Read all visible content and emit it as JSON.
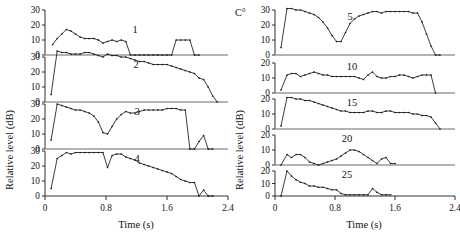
{
  "figure": {
    "y_axis_title": "Relative level (dB)",
    "x_axis_title": "Time (s)",
    "corner_label": "C°"
  },
  "axes": {
    "x_ticks": [
      "0",
      "0.8",
      "1.6",
      "2.4"
    ],
    "x_tick_values": [
      0,
      0.8,
      1.6,
      2.4
    ],
    "x_range": [
      0,
      2.4
    ],
    "y_ticks_30": [
      "0",
      "10",
      "20",
      "30"
    ],
    "y_ticks_20": [
      "0",
      "10",
      "20"
    ],
    "y_tick_values_30": [
      0,
      10,
      20,
      30
    ],
    "y_tick_values_20": [
      0,
      10,
      20
    ]
  },
  "colors": {
    "line": "#1a1a1a",
    "baseline": "#9a9a9a",
    "text": "#111111",
    "background": "#ffffff"
  },
  "chart_data": [
    {
      "type": "line",
      "title": "1",
      "panel_label": "1",
      "column": "left",
      "xlabel": "Time (s)",
      "ylabel": "Relative level (dB)",
      "xlim": [
        0,
        2.4
      ],
      "ylim": [
        0,
        30
      ],
      "grid": false,
      "legend": "none",
      "x": [
        0.1,
        0.16,
        0.22,
        0.28,
        0.34,
        0.4,
        0.46,
        0.52,
        0.58,
        0.64,
        0.7,
        0.76,
        0.82,
        0.88,
        0.94,
        1.0,
        1.06,
        1.12,
        1.18,
        1.24,
        1.3,
        1.36,
        1.42,
        1.48,
        1.54,
        1.6,
        1.66,
        1.72,
        1.78,
        1.84,
        1.9,
        1.96,
        2.02
      ],
      "y": [
        7,
        11,
        14,
        17,
        16,
        14,
        12,
        11,
        11,
        11,
        10,
        8,
        9,
        10,
        9,
        10,
        9,
        0,
        0,
        0,
        0,
        0,
        0,
        0,
        0,
        0,
        0,
        10,
        10,
        10,
        10,
        0,
        0
      ]
    },
    {
      "type": "line",
      "title": "2",
      "panel_label": "2",
      "column": "left",
      "xlabel": "Time (s)",
      "ylabel": "Relative level (dB)",
      "xlim": [
        0,
        2.4
      ],
      "ylim": [
        0,
        30
      ],
      "grid": false,
      "legend": "none",
      "x": [
        0.08,
        0.16,
        0.22,
        0.28,
        0.34,
        0.4,
        0.46,
        0.52,
        0.58,
        0.64,
        0.7,
        0.76,
        0.82,
        0.88,
        0.94,
        1.0,
        1.06,
        1.12,
        1.18,
        1.24,
        1.3,
        1.36,
        1.42,
        1.48,
        1.54,
        1.6,
        1.66,
        1.72,
        1.78,
        1.84,
        1.9,
        1.96,
        2.02,
        2.08,
        2.14,
        2.2,
        2.26
      ],
      "y": [
        5,
        34,
        33,
        33,
        32,
        32,
        32,
        33,
        33,
        32,
        31,
        30,
        32,
        31,
        31,
        30,
        30,
        29,
        28,
        27,
        27,
        26,
        25,
        25,
        25,
        25,
        24,
        23,
        22,
        21,
        20,
        19,
        16,
        15,
        10,
        4,
        0
      ]
    },
    {
      "type": "line",
      "title": "3",
      "panel_label": "3",
      "column": "left",
      "xlabel": "Time (s)",
      "ylabel": "Relative level (dB)",
      "xlim": [
        0,
        2.4
      ],
      "ylim": [
        0,
        30
      ],
      "grid": false,
      "legend": "none",
      "x": [
        0.08,
        0.16,
        0.22,
        0.28,
        0.34,
        0.4,
        0.46,
        0.52,
        0.58,
        0.64,
        0.7,
        0.76,
        0.82,
        0.88,
        0.94,
        1.0,
        1.06,
        1.12,
        1.18,
        1.24,
        1.3,
        1.36,
        1.42,
        1.48,
        1.54,
        1.6,
        1.66,
        1.72,
        1.78,
        1.84,
        1.9,
        1.96,
        2.02,
        2.08,
        2.14,
        2.2
      ],
      "y": [
        6,
        30,
        29,
        28,
        27,
        26,
        26,
        25,
        24,
        22,
        18,
        11,
        10,
        15,
        20,
        23,
        25,
        24,
        24,
        25,
        26,
        26,
        26,
        26,
        26,
        27,
        27,
        27,
        26,
        26,
        0,
        0,
        5,
        9,
        0,
        0
      ]
    },
    {
      "type": "line",
      "title": "4",
      "panel_label": "4",
      "column": "left",
      "xlabel": "Time (s)",
      "ylabel": "Relative level (dB)",
      "xlim": [
        0,
        2.4
      ],
      "ylim": [
        0,
        30
      ],
      "grid": false,
      "legend": "none",
      "x": [
        0.08,
        0.16,
        0.22,
        0.28,
        0.34,
        0.4,
        0.46,
        0.52,
        0.58,
        0.64,
        0.7,
        0.76,
        0.82,
        0.88,
        0.94,
        1.0,
        1.06,
        1.12,
        1.18,
        1.24,
        1.3,
        1.36,
        1.42,
        1.48,
        1.54,
        1.6,
        1.66,
        1.72,
        1.78,
        1.84,
        1.9,
        1.96,
        2.02,
        2.08,
        2.14,
        2.2
      ],
      "y": [
        5,
        25,
        27,
        29,
        28,
        29,
        29,
        29,
        29,
        29,
        29,
        29,
        19,
        27,
        28,
        28,
        26,
        25,
        24,
        22,
        21,
        20,
        19,
        18,
        17,
        16,
        15,
        13,
        11,
        10,
        9,
        9,
        0,
        4,
        0,
        0
      ]
    },
    {
      "type": "line",
      "title": "5",
      "panel_label": "5",
      "column": "right",
      "xlabel": "Time (s)",
      "ylabel": "Relative level (dB)",
      "xlim": [
        0,
        2.4
      ],
      "ylim": [
        0,
        30
      ],
      "grid": false,
      "legend": "none",
      "x": [
        0.08,
        0.16,
        0.22,
        0.28,
        0.34,
        0.4,
        0.46,
        0.52,
        0.58,
        0.64,
        0.7,
        0.76,
        0.82,
        0.88,
        0.94,
        1.0,
        1.06,
        1.12,
        1.18,
        1.24,
        1.3,
        1.36,
        1.42,
        1.48,
        1.54,
        1.6,
        1.66,
        1.72,
        1.78,
        1.84,
        1.9,
        1.96,
        2.02,
        2.08,
        2.14,
        2.2
      ],
      "y": [
        5,
        31,
        31,
        30,
        30,
        29,
        28,
        27,
        25,
        22,
        18,
        13,
        9,
        9,
        15,
        21,
        24,
        26,
        27,
        28,
        29,
        29,
        28,
        29,
        29,
        29,
        29,
        29,
        29,
        28,
        28,
        22,
        14,
        6,
        0,
        0
      ]
    },
    {
      "type": "line",
      "title": "10",
      "panel_label": "10",
      "column": "right",
      "xlabel": "Time (s)",
      "ylabel": "Relative level (dB)",
      "xlim": [
        0,
        2.4
      ],
      "ylim": [
        0,
        20
      ],
      "grid": false,
      "legend": "none",
      "x": [
        0.08,
        0.16,
        0.22,
        0.28,
        0.34,
        0.4,
        0.46,
        0.52,
        0.58,
        0.64,
        0.7,
        0.76,
        0.82,
        0.88,
        0.94,
        1.0,
        1.06,
        1.12,
        1.18,
        1.24,
        1.3,
        1.36,
        1.42,
        1.48,
        1.54,
        1.6,
        1.66,
        1.72,
        1.78,
        1.84,
        1.9,
        1.96,
        2.02,
        2.08,
        2.14
      ],
      "y": [
        2,
        12,
        13,
        13,
        11,
        12,
        13,
        14,
        13,
        12,
        12,
        11,
        11,
        11,
        11,
        11,
        11,
        10,
        9,
        12,
        14,
        11,
        10,
        10,
        11,
        11,
        12,
        12,
        11,
        10,
        11,
        12,
        12,
        12,
        0
      ]
    },
    {
      "type": "line",
      "title": "15",
      "panel_label": "15",
      "column": "right",
      "xlabel": "Time (s)",
      "ylabel": "Relative level (dB)",
      "xlim": [
        0,
        2.4
      ],
      "ylim": [
        0,
        20
      ],
      "grid": false,
      "legend": "none",
      "x": [
        0.08,
        0.16,
        0.22,
        0.28,
        0.34,
        0.4,
        0.46,
        0.52,
        0.58,
        0.64,
        0.7,
        0.76,
        0.82,
        0.88,
        0.94,
        1.0,
        1.06,
        1.12,
        1.18,
        1.24,
        1.3,
        1.36,
        1.42,
        1.48,
        1.54,
        1.6,
        1.66,
        1.72,
        1.78,
        1.84,
        1.9,
        1.96,
        2.02,
        2.08,
        2.14,
        2.2
      ],
      "y": [
        2,
        21,
        21,
        20,
        20,
        19,
        19,
        18,
        17,
        16,
        15,
        14,
        13,
        12,
        12,
        11,
        11,
        11,
        11,
        12,
        12,
        11,
        11,
        12,
        12,
        11,
        11,
        11,
        11,
        10,
        10,
        9,
        9,
        8,
        4,
        0
      ]
    },
    {
      "type": "line",
      "title": "20",
      "panel_label": "20",
      "column": "right",
      "xlabel": "Time (s)",
      "ylabel": "Relative level (dB)",
      "xlim": [
        0,
        2.4
      ],
      "ylim": [
        0,
        20
      ],
      "grid": false,
      "legend": "none",
      "x": [
        0.08,
        0.16,
        0.22,
        0.28,
        0.34,
        0.4,
        0.46,
        0.52,
        0.58,
        0.64,
        0.7,
        0.76,
        0.82,
        0.88,
        0.94,
        1.0,
        1.06,
        1.12,
        1.18,
        1.24,
        1.3,
        1.36,
        1.42,
        1.48,
        1.54,
        1.6
      ],
      "y": [
        0,
        7,
        5,
        7,
        7,
        5,
        2,
        1,
        0,
        1,
        2,
        3,
        4,
        6,
        8,
        10,
        10,
        9,
        7,
        5,
        3,
        1,
        4,
        5,
        1,
        1
      ]
    },
    {
      "type": "line",
      "title": "25",
      "panel_label": "25",
      "column": "right",
      "xlabel": "Time (s)",
      "ylabel": "Relative level (dB)",
      "xlim": [
        0,
        2.4
      ],
      "ylim": [
        0,
        20
      ],
      "grid": false,
      "legend": "none",
      "x": [
        0.08,
        0.16,
        0.22,
        0.28,
        0.34,
        0.4,
        0.46,
        0.52,
        0.58,
        0.64,
        0.7,
        0.76,
        0.82,
        0.88,
        0.94,
        1.0,
        1.06,
        1.12,
        1.18,
        1.24,
        1.3,
        1.36,
        1.42,
        1.48,
        1.54
      ],
      "y": [
        0,
        20,
        16,
        13,
        11,
        10,
        8,
        8,
        7,
        7,
        6,
        5,
        5,
        2,
        1,
        1,
        1,
        1,
        1,
        1,
        6,
        3,
        1,
        1,
        1
      ]
    }
  ]
}
